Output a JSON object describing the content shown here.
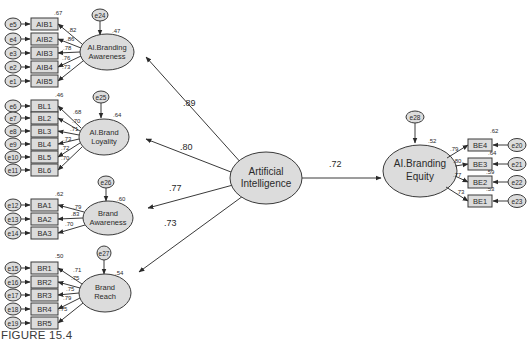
{
  "caption": "FIGURE 15.4",
  "colors": {
    "latent_fill": "#dcdcdc",
    "indicator_fill": "#dcdcdc",
    "error_fill": "#dcdcdc",
    "stroke": "#3a3a3a",
    "text": "#2a2a2a"
  },
  "central": {
    "label_lines": [
      "Artificial",
      "Intelligence"
    ]
  },
  "paths": [
    {
      "from": "Artificial Intelligence",
      "to": "AI.Branding Awareness",
      "coef": ".89"
    },
    {
      "from": "Artificial Intelligence",
      "to": "AI.Brand Loyality",
      "coef": ".80"
    },
    {
      "from": "Artificial Intelligence",
      "to": "Brand Awareness",
      "coef": ".77"
    },
    {
      "from": "Artificial Intelligence",
      "to": "Brand Reach",
      "coef": ".73"
    },
    {
      "from": "Artificial Intelligence",
      "to": "AI.Branding Equity",
      "coef": ".72"
    }
  ],
  "constructs": [
    {
      "id": "aiba",
      "label_lines": [
        "AI.Branding",
        "Awareness"
      ],
      "r2": ".47",
      "disturbance": "e24",
      "indicators": [
        {
          "name": "AIB1",
          "error": "e5",
          "r2": ".67",
          "loading": ".82"
        },
        {
          "name": "AIB2",
          "error": "e4",
          "r2": "",
          "loading": ".86"
        },
        {
          "name": "AIB3",
          "error": "e3",
          "r2": "",
          "loading": ".78"
        },
        {
          "name": "AIB4",
          "error": "e2",
          "r2": "",
          "loading": ".76"
        },
        {
          "name": "AIB5",
          "error": "e1",
          "r2": "",
          "loading": ".73"
        }
      ]
    },
    {
      "id": "aibl",
      "label_lines": [
        "AI.Brand",
        "Loyality"
      ],
      "r2": ".64",
      "disturbance": "e25",
      "indicators": [
        {
          "name": "BL1",
          "error": "e6",
          "r2": ".46",
          "loading": ".68"
        },
        {
          "name": "BL2",
          "error": "e7",
          "r2": "",
          "loading": ".70"
        },
        {
          "name": "BL3",
          "error": "e8",
          "r2": "",
          "loading": ".71"
        },
        {
          "name": "BL4",
          "error": "e9",
          "r2": "",
          "loading": ".73"
        },
        {
          "name": "BL5",
          "error": "e10",
          "r2": "",
          "loading": ".72"
        },
        {
          "name": "BL6",
          "error": "e11",
          "r2": "",
          "loading": ".70"
        }
      ]
    },
    {
      "id": "ba",
      "label_lines": [
        "Brand",
        "Awareness"
      ],
      "r2": ".60",
      "disturbance": "e26",
      "indicators": [
        {
          "name": "BA1",
          "error": "e12",
          "r2": ".62",
          "loading": ".79"
        },
        {
          "name": "BA2",
          "error": "e13",
          "r2": "",
          "loading": ".83"
        },
        {
          "name": "BA3",
          "error": "e14",
          "r2": "",
          "loading": ".70"
        }
      ]
    },
    {
      "id": "br",
      "label_lines": [
        "Brand",
        "Reach"
      ],
      "r2": ".54",
      "disturbance": "e27",
      "indicators": [
        {
          "name": "BR1",
          "error": "e15",
          "r2": ".50",
          "loading": ".71"
        },
        {
          "name": "BR2",
          "error": "e16",
          "r2": "",
          "loading": ".75"
        },
        {
          "name": "BR3",
          "error": "e17",
          "r2": "",
          "loading": ".75"
        },
        {
          "name": "BR4",
          "error": "e18",
          "r2": "",
          "loading": ".79"
        },
        {
          "name": "BR5",
          "error": "e19",
          "r2": "",
          "loading": ".75"
        }
      ]
    },
    {
      "id": "aibe",
      "label_lines": [
        "AI.Branding",
        "Equity"
      ],
      "r2": ".52",
      "disturbance": "e28",
      "indicators": [
        {
          "name": "BE4",
          "error": "e20",
          "r2": ".62",
          "loading": ".79"
        },
        {
          "name": "BE3",
          "error": "e21",
          "r2": ".64",
          "loading": ".80"
        },
        {
          "name": "BE2",
          "error": "e22",
          "r2": ".59",
          "loading": ".77"
        },
        {
          "name": "BE1",
          "error": "e23",
          "r2": ".53",
          "loading": ".73"
        }
      ]
    }
  ]
}
